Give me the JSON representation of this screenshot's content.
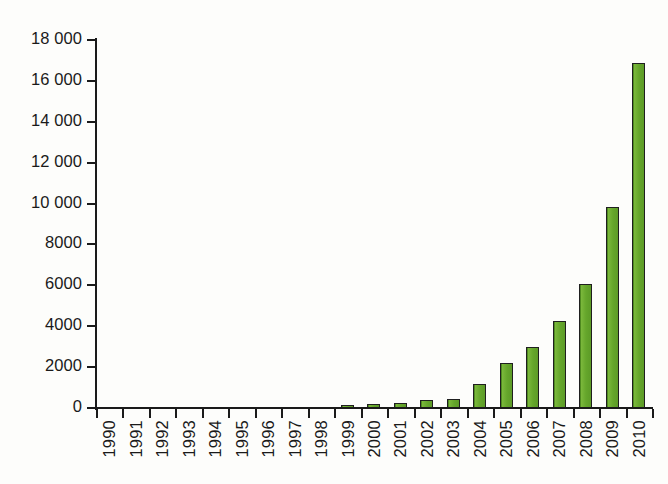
{
  "chart_data": {
    "type": "bar",
    "title": "",
    "subtitle": "",
    "xlabel": "",
    "ylabel": "",
    "categories": [
      "1990",
      "1991",
      "1992",
      "1993",
      "1994",
      "1995",
      "1996",
      "1997",
      "1998",
      "1999",
      "2000",
      "2001",
      "2002",
      "2003",
      "2004",
      "2005",
      "2006",
      "2007",
      "2008",
      "2009",
      "2010"
    ],
    "values": [
      0,
      0,
      0,
      0,
      0,
      0,
      0,
      0,
      0,
      150,
      180,
      250,
      400,
      450,
      1180,
      2200,
      3000,
      4250,
      6050,
      9830,
      16900
    ],
    "ylim": [
      0,
      18000
    ],
    "ytick_values": [
      0,
      2000,
      4000,
      6000,
      8000,
      10000,
      12000,
      14000,
      16000,
      18000
    ],
    "ytick_labels": [
      "0",
      "2000",
      "4000",
      "6000",
      "8000",
      "10 000",
      "12 000",
      "14 000",
      "16 000",
      "18 000"
    ],
    "grid": false,
    "legend": null,
    "legend_position": "none",
    "annotations": [],
    "xtick_label_rotation": 90,
    "series_color": "#6aab2e",
    "series_outline_color": "#1f1f1f",
    "axis_color": "#1a1a1a",
    "background_color": "#fdfdfb"
  }
}
